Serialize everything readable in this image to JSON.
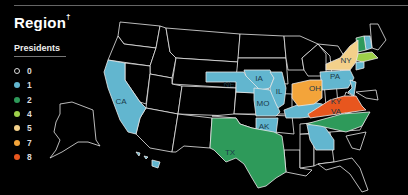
{
  "header": {
    "title": "Region",
    "title_mark": "†"
  },
  "legend": {
    "title": "Presidents",
    "items": [
      {
        "label": "0",
        "color": "#000000",
        "outline": true
      },
      {
        "label": "1",
        "color": "#62b6cf"
      },
      {
        "label": "2",
        "color": "#2e9a5a"
      },
      {
        "label": "4",
        "color": "#9ed04a"
      },
      {
        "label": "5",
        "color": "#f3d08a"
      },
      {
        "label": "7",
        "color": "#f3a43a"
      },
      {
        "label": "8",
        "color": "#e8561e"
      }
    ]
  },
  "states": [
    {
      "abbr": "CA",
      "presidents": 1
    },
    {
      "abbr": "NE",
      "presidents": 1
    },
    {
      "abbr": "IA",
      "presidents": 1
    },
    {
      "abbr": "IL",
      "presidents": 1
    },
    {
      "abbr": "MO",
      "presidents": 1
    },
    {
      "abbr": "AK",
      "presidents": 1
    },
    {
      "abbr": "KY",
      "presidents": 1
    },
    {
      "abbr": "PA",
      "presidents": 1
    },
    {
      "abbr": "GA",
      "presidents": 1
    },
    {
      "abbr": "HI",
      "presidents": 1
    },
    {
      "abbr": "NJ",
      "presidents": 1
    },
    {
      "abbr": "TX",
      "presidents": 2
    },
    {
      "abbr": "NC",
      "presidents": 2
    },
    {
      "abbr": "VT",
      "presidents": 2
    },
    {
      "abbr": "NH",
      "presidents": 1
    },
    {
      "abbr": "MA",
      "presidents": 4
    },
    {
      "abbr": "NY",
      "presidents": 5
    },
    {
      "abbr": "OH",
      "presidents": 7
    },
    {
      "abbr": "VA",
      "presidents": 8
    },
    {
      "abbr": "CT",
      "presidents": 1
    }
  ]
}
